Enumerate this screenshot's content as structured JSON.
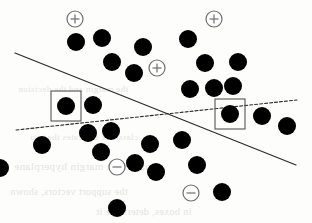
{
  "figure": {
    "background_color": "#fdfdfc",
    "ink_color": "#000000",
    "marker_outline_color": "#6e6e6e"
  },
  "ghost_text": {
    "note": "faint reversed show-through text from the reverse side of the scanned page",
    "color": "#cfcfcb",
    "lines": [
      {
        "text": "the margin and the decision",
        "x": 18,
        "y": 84,
        "size": 9
      },
      {
        "text": "classifier separates the two",
        "x": 30,
        "y": 132,
        "size": 9
      },
      {
        "text": "a maximum margin hyperplane",
        "x": 14,
        "y": 160,
        "size": 11
      },
      {
        "text": "the support vectors, shown",
        "x": 10,
        "y": 186,
        "size": 10
      },
      {
        "text": "in boxes, determine it",
        "x": 96,
        "y": 206,
        "size": 10
      }
    ]
  },
  "chart_data": {
    "type": "scatter",
    "xlabel": "",
    "ylabel": "",
    "xlim": [
      0,
      312
    ],
    "ylim": [
      0,
      223
    ],
    "grid": false,
    "legend": "none",
    "coordinate_note": "Coordinates are given in image pixel space; y increases downward.",
    "series": [
      {
        "name": "data points",
        "marker": "filled-circle",
        "color": "#000000",
        "radius": 9,
        "points": [
          {
            "x": 76,
            "y": 42
          },
          {
            "x": 102,
            "y": 38
          },
          {
            "x": 143,
            "y": 47
          },
          {
            "x": 112,
            "y": 62
          },
          {
            "x": 134,
            "y": 73
          },
          {
            "x": 188,
            "y": 39
          },
          {
            "x": 205,
            "y": 63
          },
          {
            "x": 238,
            "y": 62
          },
          {
            "x": 190,
            "y": 89
          },
          {
            "x": 214,
            "y": 88
          },
          {
            "x": 233,
            "y": 86
          },
          {
            "x": 66,
            "y": 106
          },
          {
            "x": 93,
            "y": 105
          },
          {
            "x": 230,
            "y": 114
          },
          {
            "x": 262,
            "y": 116
          },
          {
            "x": 287,
            "y": 126
          },
          {
            "x": 88,
            "y": 133
          },
          {
            "x": 111,
            "y": 131
          },
          {
            "x": 42,
            "y": 145
          },
          {
            "x": 150,
            "y": 144
          },
          {
            "x": 182,
            "y": 140
          },
          {
            "x": 101,
            "y": 152
          },
          {
            "x": 135,
            "y": 163
          },
          {
            "x": 156,
            "y": 172
          },
          {
            "x": 197,
            "y": 165
          },
          {
            "x": 0,
            "y": 168
          },
          {
            "x": 222,
            "y": 192
          },
          {
            "x": 117,
            "y": 208
          }
        ]
      },
      {
        "name": "plus-labelled points",
        "marker": "circled-plus",
        "color": "#6e6e6e",
        "radius": 8,
        "label": "+",
        "points": [
          {
            "x": 75,
            "y": 19
          },
          {
            "x": 214,
            "y": 19
          },
          {
            "x": 157,
            "y": 68
          }
        ]
      },
      {
        "name": "minus-labelled points",
        "marker": "circled-minus",
        "color": "#6e6e6e",
        "radius": 8,
        "label": "−",
        "points": [
          {
            "x": 117,
            "y": 167
          },
          {
            "x": 191,
            "y": 193
          }
        ]
      },
      {
        "name": "support vectors",
        "marker": "boxed-filled-circle",
        "color": "#000000",
        "box_stroke": "#555555",
        "box_size": 30,
        "radius": 9,
        "points": [
          {
            "x": 66,
            "y": 106
          },
          {
            "x": 230,
            "y": 114
          }
        ]
      }
    ],
    "lines": [
      {
        "name": "solid-boundary",
        "style": "solid",
        "color": "#2a2a2a",
        "width": 1.2,
        "x1": 15,
        "y1": 53,
        "x2": 296,
        "y2": 165
      },
      {
        "name": "dashed-boundary",
        "style": "dashed",
        "color": "#2a2a2a",
        "width": 1.1,
        "dash": "3 2",
        "x1": 16,
        "y1": 130,
        "x2": 297,
        "y2": 100
      }
    ]
  }
}
